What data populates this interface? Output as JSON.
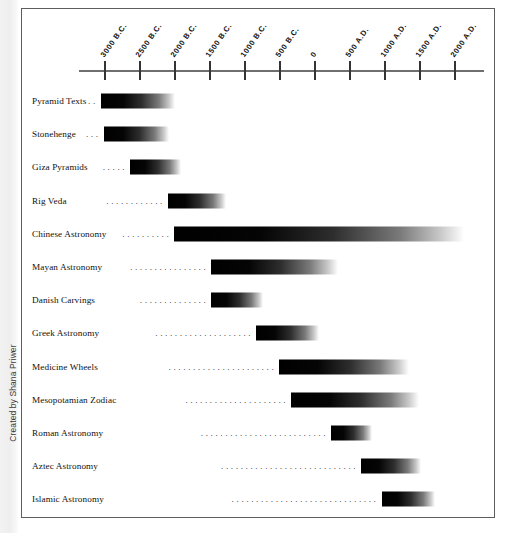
{
  "credit": {
    "text": "Created by Shana Priwer"
  },
  "chart_data": {
    "type": "bar",
    "title": "",
    "subtitle": "",
    "xlabel": "",
    "ylabel": "",
    "orientation": "horizontal",
    "grid": false,
    "legend": "none",
    "note": "Horizontal gradient range bars; each bar spans a start year to an end year on a B.C./A.D. timeline. Gradient fades black-to-white left-to-right indicating uncertain end dates.",
    "axis": {
      "min_year": -3000,
      "max_year": 2000,
      "tick_step_years": 500,
      "tick_labels": [
        "3000 B.C.",
        "2500 B.C.",
        "2000 B.C.",
        "1500 B.C.",
        "1000 B.C.",
        "500 B.C.",
        "0",
        "500 A.D.",
        "1000 A.D.",
        "1500 A.D.",
        "2000 A.D."
      ],
      "tick_years": [
        -3000,
        -2500,
        -2000,
        -1500,
        -1000,
        -500,
        0,
        500,
        1000,
        1500,
        2000
      ]
    },
    "categories": [
      "Pyramid Texts",
      "Stonehenge",
      "Giza Pyramids",
      "Rig Veda",
      "Chinese Astronomy",
      "Mayan Astronomy",
      "Danish Carvings",
      "Greek Astronomy",
      "Medicine Wheels",
      "Mesopotamian Zodiac",
      "Roman Astronomy",
      "Aztec Astronomy",
      "Islamic Astronomy"
    ],
    "bars": [
      {
        "label": "Pyramid Texts",
        "start_year": -3060,
        "end_year": -2000,
        "leader_dots": 2
      },
      {
        "label": "Stonehenge",
        "start_year": -3020,
        "end_year": -2090,
        "leader_dots": 3
      },
      {
        "label": "Giza Pyramids",
        "start_year": -2640,
        "end_year": -1910,
        "leader_dots": 5
      },
      {
        "label": "Rig Veda",
        "start_year": -2100,
        "end_year": -1270,
        "leader_dots": 12
      },
      {
        "label": "Chinese Astronomy",
        "start_year": -2010,
        "end_year": 2130,
        "leader_dots": 10
      },
      {
        "label": "Mayan Astronomy",
        "start_year": -1480,
        "end_year": 330,
        "leader_dots": 16
      },
      {
        "label": "Danish Carvings",
        "start_year": -1480,
        "end_year": -740,
        "leader_dots": 14
      },
      {
        "label": "Greek Astronomy",
        "start_year": -840,
        "end_year": 60,
        "leader_dots": 20
      },
      {
        "label": "Medicine Wheels",
        "start_year": -510,
        "end_year": 1350,
        "leader_dots": 22
      },
      {
        "label": "Mesopotamian Zodiac",
        "start_year": -340,
        "end_year": 1490,
        "leader_dots": 21
      },
      {
        "label": "Roman Astronomy",
        "start_year": 230,
        "end_year": 820,
        "leader_dots": 26
      },
      {
        "label": "Aztec Astronomy",
        "start_year": 660,
        "end_year": 1520,
        "leader_dots": 28
      },
      {
        "label": "Islamic Astronomy",
        "start_year": 950,
        "end_year": 1720,
        "leader_dots": 30
      }
    ]
  }
}
